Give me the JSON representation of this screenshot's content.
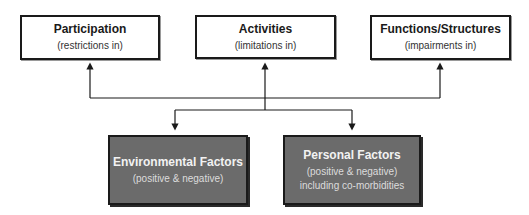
{
  "diagram": {
    "top_boxes": [
      {
        "title": "Participation",
        "subtitle": "(restrictions in)"
      },
      {
        "title": "Activities",
        "subtitle": "(limitations in)"
      },
      {
        "title": "Functions/Structures",
        "subtitle": "(impairments in)"
      }
    ],
    "bottom_boxes": [
      {
        "title": "Environmental Factors",
        "subtitle": "(positive & negative)"
      },
      {
        "title": "Personal Factors",
        "subtitle": "(positive & negative) including co-morbidities"
      }
    ],
    "connections": [
      {
        "from": "factors",
        "to": "Participation"
      },
      {
        "from": "factors",
        "to": "Activities"
      },
      {
        "from": "factors",
        "to": "Functions/Structures"
      },
      {
        "from": "components",
        "to": "Environmental Factors"
      },
      {
        "from": "components",
        "to": "Personal Factors"
      }
    ],
    "colors": {
      "top_box_fill": "#ffffff",
      "bottom_box_fill": "#6b6b6b",
      "border": "#1a1a1a",
      "line": "#1a1a1a"
    }
  }
}
